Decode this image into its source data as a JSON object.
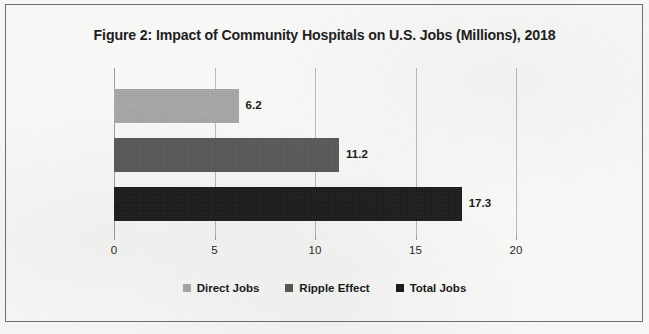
{
  "figure": {
    "title": "Figure 2: Impact of Community Hospitals on U.S. Jobs (Millions), 2018",
    "background_color": "#f7f7f5",
    "border_color": "#6f6f6f",
    "gridline_color": "#b9b9b9"
  },
  "chart_data": {
    "type": "bar",
    "orientation": "horizontal",
    "title": "Figure 2: Impact of Community Hospitals on U.S. Jobs (Millions), 2018",
    "xlabel": "",
    "ylabel": "",
    "xlim": [
      0,
      20
    ],
    "xticks": [
      0,
      5,
      10,
      15,
      20
    ],
    "xtick_labels": [
      "0",
      "5",
      "10",
      "15",
      "20"
    ],
    "grid": true,
    "legend_position": "bottom",
    "categories": [
      "Direct Jobs",
      "Ripple Effect",
      "Total Jobs"
    ],
    "values": [
      6.2,
      11.2,
      17.3
    ],
    "value_labels": [
      "6.2",
      "11.2",
      "17.3"
    ],
    "colors": [
      "#a8a8a8",
      "#595959",
      "#1c1c1c"
    ],
    "series": [
      {
        "name": "Direct Jobs",
        "value": 6.2,
        "label": "6.2",
        "color": "#a8a8a8"
      },
      {
        "name": "Ripple Effect",
        "value": 11.2,
        "label": "11.2",
        "color": "#595959"
      },
      {
        "name": "Total Jobs",
        "value": 17.3,
        "label": "17.3",
        "color": "#1c1c1c"
      }
    ]
  },
  "legend": {
    "items": [
      {
        "label": "Direct Jobs",
        "color": "#a8a8a8"
      },
      {
        "label": "Ripple Effect",
        "color": "#595959"
      },
      {
        "label": "Total Jobs",
        "color": "#1c1c1c"
      }
    ]
  }
}
